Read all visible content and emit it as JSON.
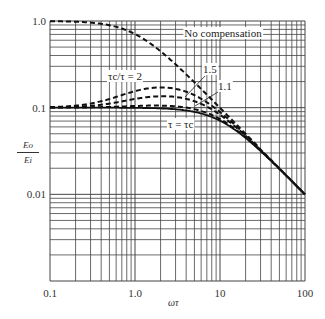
{
  "chart_data": {
    "type": "line",
    "title": "",
    "xlabel": "ωτ",
    "ylabel": "Eo/Ei",
    "xscale": "log",
    "yscale": "log",
    "xlim": [
      0.1,
      100
    ],
    "ylim": [
      0.001,
      1.0
    ],
    "grid": true,
    "x_ticks": [
      "0.1",
      "1.0",
      "10",
      "100"
    ],
    "y_ticks": [
      "1.0",
      "0.1",
      "0.01"
    ],
    "x": [
      0.1,
      0.2,
      0.5,
      1,
      2,
      3,
      5,
      10,
      20,
      50,
      100
    ],
    "series": [
      {
        "name": "No compensation",
        "style": "dashed",
        "values": [
          0.995,
          0.981,
          0.894,
          0.707,
          0.447,
          0.316,
          0.196,
          0.0995,
          0.05,
          null,
          null
        ]
      },
      {
        "name": "τc/τ = 2",
        "style": "dashed",
        "values": [
          0.1,
          0.106,
          0.13,
          0.155,
          0.171,
          0.165,
          0.139,
          0.089,
          0.0485,
          0.0198,
          0.00998
        ]
      },
      {
        "name": "1.5",
        "style": "dashed",
        "values": [
          0.1,
          0.103,
          0.116,
          0.126,
          0.1355,
          0.133,
          0.1188,
          0.083,
          0.0474,
          0.0197,
          0.00997
        ]
      },
      {
        "name": "1.1",
        "style": "dashed",
        "values": [
          0.1,
          0.1005,
          0.103,
          0.1045,
          0.1056,
          0.103,
          0.0961,
          0.0739,
          0.0455,
          0.0196,
          0.00996
        ]
      },
      {
        "name": "τ = τc",
        "style": "solid",
        "values": [
          0.1,
          0.1,
          0.0999,
          0.0995,
          0.098,
          0.0958,
          0.0894,
          0.0707,
          0.0447,
          0.0196,
          0.00995
        ]
      }
    ],
    "annotations": [
      "No compensation",
      "τc/τ = 2",
      "1.5",
      "1.1",
      "τ = τc"
    ]
  },
  "labels": {
    "x_axis": "ωτ",
    "y_num": "Eo",
    "y_den": "Ei",
    "no_comp": "No compensation",
    "r2": "τc/τ = 2",
    "r15": "1.5",
    "r11": "1.1",
    "r1": "τ = τc"
  }
}
